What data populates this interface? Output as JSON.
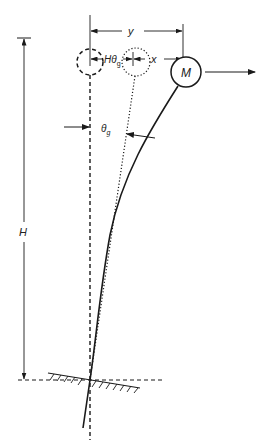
{
  "diagram": {
    "title": "",
    "labels": {
      "y": "y",
      "h_theta": "Hθ",
      "h_theta_sub": "g",
      "x": "x",
      "theta": "θ",
      "theta_sub": "g",
      "H": "H",
      "M": "M"
    },
    "colors": {
      "line": "#1a1a1a",
      "background": "#ffffff"
    },
    "elements": [
      "original-position-dashed-circle",
      "rigid-rotation-dotted-circle",
      "deflected-mass-M-circle",
      "horizontal-force-arrow",
      "ground-line-hatched",
      "height-dimension-H",
      "displacement-dimensions-y-x-Htheta"
    ]
  }
}
